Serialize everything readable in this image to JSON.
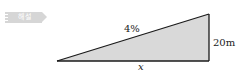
{
  "badge": {
    "label": "해설",
    "color": "#d6d6d6"
  },
  "diagram": {
    "shape": "right-triangle",
    "fill": "#d9d9d9",
    "stroke": "#1a1a1a",
    "vertices": {
      "left": [
        57,
        61
      ],
      "right_bottom": [
        209,
        61
      ],
      "right_top": [
        209,
        14
      ]
    },
    "labels": {
      "slope": "4%",
      "height": "20m",
      "base": "x"
    }
  }
}
